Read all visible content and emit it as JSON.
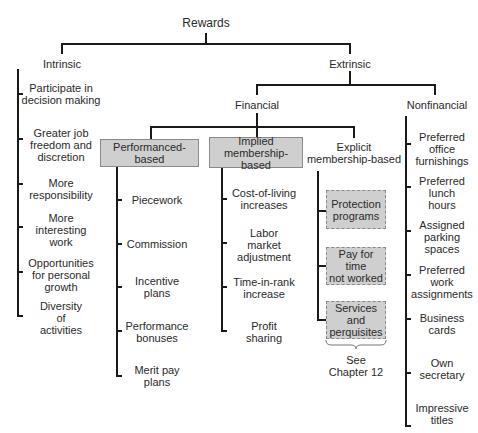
{
  "root": {
    "label": "Rewards"
  },
  "intrinsic": {
    "label": "Intrinsic",
    "items": [
      "Participate in\ndecision making",
      "Greater job\nfreedom and\ndiscretion",
      "More\nresponsibility",
      "More\ninteresting\nwork",
      "Opportunities\nfor personal\ngrowth",
      "Diversity\nof\nactivities"
    ]
  },
  "extrinsic": {
    "label": "Extrinsic",
    "financial": {
      "label": "Financial",
      "performance": {
        "label": "Performanced-based",
        "items": [
          "Piecework",
          "Commission",
          "Incentive\nplans",
          "Performance\nbonuses",
          "Merit pay\nplans"
        ]
      },
      "implied": {
        "label": "Implied\nmembership-based",
        "items": [
          "Cost-of-living\nincreases",
          "Labor\nmarket\nadjustment",
          "Time-in-rank\nincrease",
          "Profit\nsharing"
        ]
      },
      "explicit": {
        "label": "Explicit\nmembership-based",
        "items": [
          "Protection\nprograms",
          "Pay for time\nnot worked",
          "Services\nand\nperquisites"
        ],
        "note": "See\nChapter 12"
      }
    },
    "nonfinancial": {
      "label": "Nonfinancial",
      "items": [
        "Preferred\noffice\nfurnishings",
        "Preferred\nlunch\nhours",
        "Assigned\nparking\nspaces",
        "Preferred\nwork\nassignments",
        "Business\ncards",
        "Own\nsecretary",
        "Impressive\ntitles"
      ]
    }
  },
  "colors": {
    "box_fill": "#cfcfcf",
    "box_border": "#8a8a8a",
    "line": "#1a1a1a",
    "text": "#2a2a2a"
  }
}
